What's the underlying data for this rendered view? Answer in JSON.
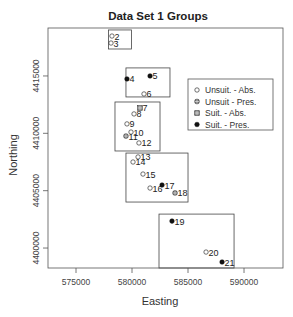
{
  "chart_data": {
    "type": "scatter",
    "title": "Data Set 1 Groups",
    "xlabel": "Easting",
    "ylabel": "Northing",
    "xlim": [
      572500,
      593480
    ],
    "ylim": [
      4398260,
      4419180
    ],
    "xticks": [
      575000,
      580000,
      585000,
      590000
    ],
    "xtick_labels": [
      "575000",
      "580000",
      "585000",
      "590000"
    ],
    "yticks": [
      4400000,
      4405000,
      4410000,
      4415000
    ],
    "ytick_labels": [
      "4400000",
      "4405000",
      "4410000",
      "4415000"
    ],
    "grid": false,
    "legend_position": "right",
    "legend": [
      {
        "key": "unsuit_abs",
        "label": "Unsuit. - Abs."
      },
      {
        "key": "unsuit_pres",
        "label": "Unsuit - Pres."
      },
      {
        "key": "suit_abs",
        "label": "Suit. - Abs."
      },
      {
        "key": "suit_pres",
        "label": "Suit. - Pres."
      }
    ],
    "points": [
      {
        "id": "2",
        "x": 578210,
        "y": 4418480,
        "class": "unsuit_abs"
      },
      {
        "id": "3",
        "x": 578125,
        "y": 4417870,
        "class": "unsuit_abs"
      },
      {
        "id": "4",
        "x": 579550,
        "y": 4414740,
        "class": "suit_pres"
      },
      {
        "id": "5",
        "x": 581610,
        "y": 4415000,
        "class": "suit_pres"
      },
      {
        "id": "6",
        "x": 581070,
        "y": 4413430,
        "class": "unsuit_abs"
      },
      {
        "id": "7",
        "x": 580710,
        "y": 4412210,
        "class": "suit_abs"
      },
      {
        "id": "8",
        "x": 580180,
        "y": 4411690,
        "class": "unsuit_abs"
      },
      {
        "id": "9",
        "x": 579550,
        "y": 4410820,
        "class": "unsuit_abs"
      },
      {
        "id": "10",
        "x": 579910,
        "y": 4410110,
        "class": "unsuit_abs"
      },
      {
        "id": "11",
        "x": 579460,
        "y": 4409760,
        "class": "unsuit_pres"
      },
      {
        "id": "12",
        "x": 580620,
        "y": 4409160,
        "class": "unsuit_abs"
      },
      {
        "id": "13",
        "x": 580540,
        "y": 4407940,
        "class": "unsuit_abs"
      },
      {
        "id": "14",
        "x": 580090,
        "y": 4407500,
        "class": "unsuit_abs"
      },
      {
        "id": "15",
        "x": 580980,
        "y": 4406450,
        "class": "unsuit_abs"
      },
      {
        "id": "16",
        "x": 581610,
        "y": 4405230,
        "class": "unsuit_abs"
      },
      {
        "id": "17",
        "x": 582680,
        "y": 4405490,
        "class": "suit_pres"
      },
      {
        "id": "18",
        "x": 583840,
        "y": 4404800,
        "class": "unsuit_pres"
      },
      {
        "id": "19",
        "x": 583570,
        "y": 4402350,
        "class": "suit_pres"
      },
      {
        "id": "20",
        "x": 586610,
        "y": 4399650,
        "class": "unsuit_abs"
      },
      {
        "id": "21",
        "x": 588040,
        "y": 4398780,
        "class": "suit_pres"
      }
    ],
    "group_boxes": [
      {
        "name": "group-2-3",
        "x": [
          577910,
          579960
        ],
        "y": [
          4417350,
          4419010
        ]
      },
      {
        "name": "group-4-6",
        "x": [
          579460,
          583390
        ],
        "y": [
          4413170,
          4415700
        ]
      },
      {
        "name": "group-7-12",
        "x": [
          578480,
          582500
        ],
        "y": [
          4408460,
          4412730
        ]
      },
      {
        "name": "group-13-18",
        "x": [
          579460,
          585000
        ],
        "y": [
          4404010,
          4408280
        ]
      },
      {
        "name": "group-19-21",
        "x": [
          582410,
          589110
        ],
        "y": [
          4398260,
          4402960
        ]
      }
    ]
  }
}
